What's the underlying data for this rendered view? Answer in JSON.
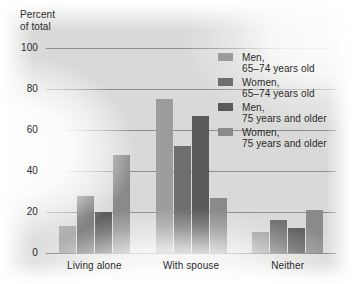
{
  "axis_title": {
    "line1": "Percent",
    "line2": "of total"
  },
  "legend": {
    "entries": [
      {
        "line1": "Men,",
        "line2": "65–74 years old",
        "color": "#9c9c9c"
      },
      {
        "line1": "Women,",
        "line2": "65–74 years old",
        "color": "#6e6e6e"
      },
      {
        "line1": "Men,",
        "line2": "75 years and older",
        "color": "#5a5a5a"
      },
      {
        "line1": "Women,",
        "line2": "75 years and older",
        "color": "#8a8a8a"
      }
    ]
  },
  "chart_data": {
    "type": "bar",
    "title": "",
    "subtitle": "",
    "xlabel": "",
    "ylabel": "Percent of total",
    "ylim": [
      0,
      100
    ],
    "yticks": [
      0,
      20,
      40,
      60,
      80,
      100
    ],
    "ytick_labels": [
      "0",
      "20",
      "40",
      "60",
      "80",
      "100"
    ],
    "grid": true,
    "grid_axis": "y",
    "legend_position": "inside-upper-right",
    "categories": [
      "Living alone",
      "With spouse",
      "Neither"
    ],
    "series": [
      {
        "name": "Men, 65–74 years old",
        "color": "#9c9c9c",
        "values": [
          13,
          75,
          10
        ]
      },
      {
        "name": "Women, 65–74 years old",
        "color": "#6e6e6e",
        "values": [
          28,
          52,
          16
        ]
      },
      {
        "name": "Men, 75 years and older",
        "color": "#5a5a5a",
        "values": [
          20,
          67,
          12
        ]
      },
      {
        "name": "Women, 75 years and older",
        "color": "#8a8a8a",
        "values": [
          48,
          27,
          21
        ]
      }
    ]
  }
}
